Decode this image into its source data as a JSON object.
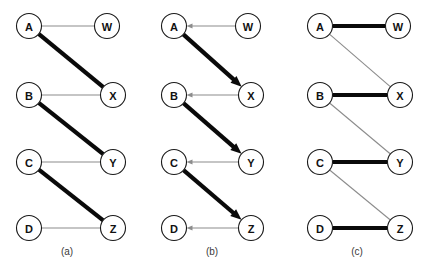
{
  "figure": {
    "background": "#ffffff",
    "width": 427,
    "height": 275,
    "colors": {
      "thick_edge": "#0a0a0a",
      "thin_edge": "#8c8c8c",
      "node_stroke": "#1a1a1a",
      "node_fill": "#ffffff",
      "label_text": "#111111",
      "caption_text": "#3a3a3a"
    }
  },
  "panels": [
    {
      "id": "panel-a",
      "caption": "(a)",
      "caption_x": 67,
      "caption_y": 255,
      "directed": false,
      "nodes": [
        {
          "id": "A",
          "label": "A",
          "cx": 29,
          "cy": 26,
          "r": 12.5
        },
        {
          "id": "W",
          "label": "W",
          "cx": 107,
          "cy": 26,
          "r": 12.5
        },
        {
          "id": "B",
          "label": "B",
          "cx": 29,
          "cy": 95,
          "r": 12.5
        },
        {
          "id": "X",
          "label": "X",
          "cx": 113,
          "cy": 95,
          "r": 12.5
        },
        {
          "id": "C",
          "label": "C",
          "cx": 29,
          "cy": 162,
          "r": 12.5
        },
        {
          "id": "Y",
          "label": "Y",
          "cx": 113,
          "cy": 162,
          "r": 12.5
        },
        {
          "id": "D",
          "label": "D",
          "cx": 29,
          "cy": 228,
          "r": 12.5
        },
        {
          "id": "Z",
          "label": "Z",
          "cx": 113,
          "cy": 228,
          "r": 12.5
        }
      ],
      "edges": [
        {
          "from": "A",
          "to": "W",
          "weight": "thin",
          "arrow": "none"
        },
        {
          "from": "A",
          "to": "X",
          "weight": "thick",
          "arrow": "none"
        },
        {
          "from": "B",
          "to": "X",
          "weight": "thin",
          "arrow": "none"
        },
        {
          "from": "B",
          "to": "Y",
          "weight": "thick",
          "arrow": "none"
        },
        {
          "from": "C",
          "to": "Y",
          "weight": "thin",
          "arrow": "none"
        },
        {
          "from": "C",
          "to": "Z",
          "weight": "thick",
          "arrow": "none"
        },
        {
          "from": "D",
          "to": "Z",
          "weight": "thin",
          "arrow": "none"
        }
      ]
    },
    {
      "id": "panel-b",
      "caption": "(b)",
      "caption_x": 212,
      "caption_y": 255,
      "directed": true,
      "nodes": [
        {
          "id": "A",
          "label": "A",
          "cx": 174,
          "cy": 26,
          "r": 12.5
        },
        {
          "id": "W",
          "label": "W",
          "cx": 248,
          "cy": 26,
          "r": 12.5
        },
        {
          "id": "B",
          "label": "B",
          "cx": 174,
          "cy": 95,
          "r": 12.5
        },
        {
          "id": "X",
          "label": "X",
          "cx": 251,
          "cy": 95,
          "r": 12.5
        },
        {
          "id": "C",
          "label": "C",
          "cx": 174,
          "cy": 162,
          "r": 12.5
        },
        {
          "id": "Y",
          "label": "Y",
          "cx": 251,
          "cy": 162,
          "r": 12.5
        },
        {
          "id": "D",
          "label": "D",
          "cx": 174,
          "cy": 228,
          "r": 12.5
        },
        {
          "id": "Z",
          "label": "Z",
          "cx": 251,
          "cy": 228,
          "r": 12.5
        }
      ],
      "edges": [
        {
          "from": "W",
          "to": "A",
          "weight": "thin",
          "arrow": "target"
        },
        {
          "from": "A",
          "to": "X",
          "weight": "thick",
          "arrow": "target"
        },
        {
          "from": "X",
          "to": "B",
          "weight": "thin",
          "arrow": "target"
        },
        {
          "from": "B",
          "to": "Y",
          "weight": "thick",
          "arrow": "target"
        },
        {
          "from": "Y",
          "to": "C",
          "weight": "thin",
          "arrow": "target"
        },
        {
          "from": "C",
          "to": "Z",
          "weight": "thick",
          "arrow": "target"
        },
        {
          "from": "Z",
          "to": "D",
          "weight": "thin",
          "arrow": "target"
        }
      ]
    },
    {
      "id": "panel-c",
      "caption": "(c)",
      "caption_x": 357,
      "caption_y": 255,
      "directed": false,
      "nodes": [
        {
          "id": "A",
          "label": "A",
          "cx": 320,
          "cy": 26,
          "r": 12.5
        },
        {
          "id": "W",
          "label": "W",
          "cx": 398,
          "cy": 26,
          "r": 12.5
        },
        {
          "id": "B",
          "label": "B",
          "cx": 320,
          "cy": 95,
          "r": 12.5
        },
        {
          "id": "X",
          "label": "X",
          "cx": 400,
          "cy": 95,
          "r": 12.5
        },
        {
          "id": "C",
          "label": "C",
          "cx": 320,
          "cy": 162,
          "r": 12.5
        },
        {
          "id": "Y",
          "label": "Y",
          "cx": 400,
          "cy": 162,
          "r": 12.5
        },
        {
          "id": "D",
          "label": "D",
          "cx": 320,
          "cy": 228,
          "r": 12.5
        },
        {
          "id": "Z",
          "label": "Z",
          "cx": 400,
          "cy": 228,
          "r": 12.5
        }
      ],
      "edges": [
        {
          "from": "A",
          "to": "W",
          "weight": "thick",
          "arrow": "none"
        },
        {
          "from": "A",
          "to": "X",
          "weight": "thin",
          "arrow": "none"
        },
        {
          "from": "B",
          "to": "X",
          "weight": "thick",
          "arrow": "none"
        },
        {
          "from": "B",
          "to": "Y",
          "weight": "thin",
          "arrow": "none"
        },
        {
          "from": "C",
          "to": "Y",
          "weight": "thick",
          "arrow": "none"
        },
        {
          "from": "C",
          "to": "Z",
          "weight": "thin",
          "arrow": "none"
        },
        {
          "from": "D",
          "to": "Z",
          "weight": "thick",
          "arrow": "none"
        }
      ]
    }
  ]
}
